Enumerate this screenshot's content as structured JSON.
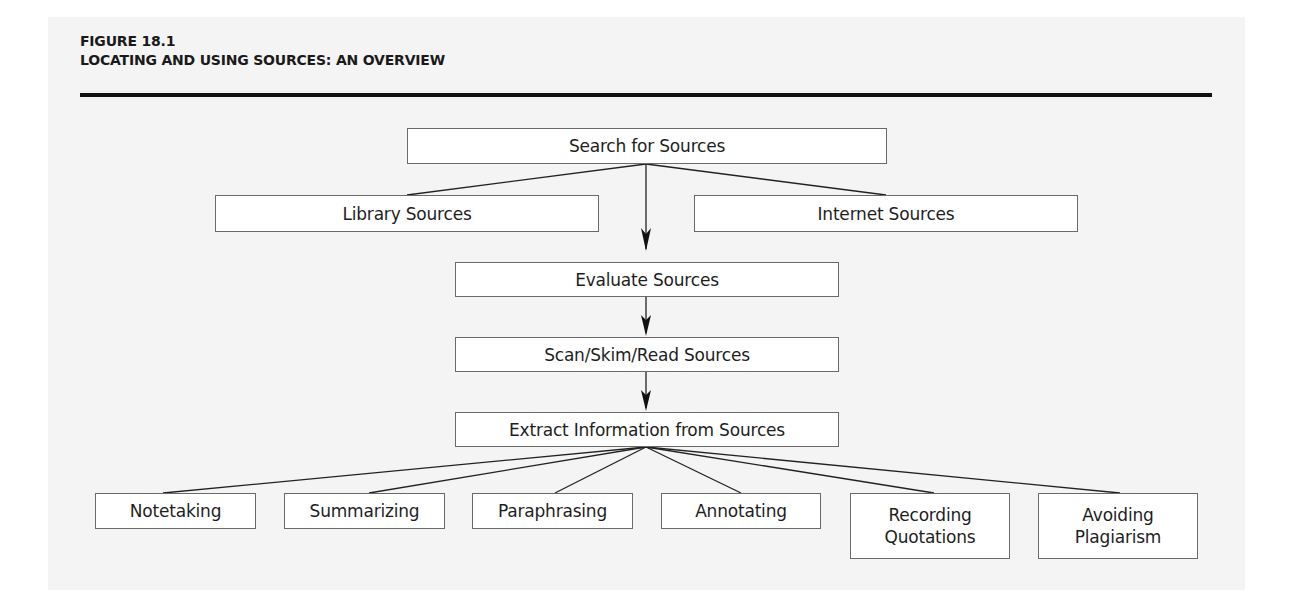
{
  "figure": {
    "label": "FIGURE 18.1",
    "title": "LOCATING AND USING SOURCES: AN OVERVIEW"
  },
  "nodes": {
    "search": "Search for Sources",
    "library": "Library Sources",
    "internet": "Internet Sources",
    "evaluate": "Evaluate Sources",
    "scan": "Scan/Skim/Read Sources",
    "extract": "Extract Information from Sources",
    "notetaking": "Notetaking",
    "summarizing": "Summarizing",
    "paraphrasing": "Paraphrasing",
    "annotating": "Annotating",
    "recording": {
      "line1": "Recording",
      "line2": "Quotations"
    },
    "avoiding": {
      "line1": "Avoiding",
      "line2": "Plagiarism"
    }
  },
  "edges": [
    {
      "from": "Search for Sources",
      "to": "Library Sources",
      "type": "line"
    },
    {
      "from": "Search for Sources",
      "to": "Internet Sources",
      "type": "line"
    },
    {
      "from": "Search for Sources",
      "to": "Evaluate Sources",
      "type": "arrow"
    },
    {
      "from": "Evaluate Sources",
      "to": "Scan/Skim/Read Sources",
      "type": "arrow"
    },
    {
      "from": "Scan/Skim/Read Sources",
      "to": "Extract Information from Sources",
      "type": "arrow"
    },
    {
      "from": "Extract Information from Sources",
      "to": "Notetaking",
      "type": "line"
    },
    {
      "from": "Extract Information from Sources",
      "to": "Summarizing",
      "type": "line"
    },
    {
      "from": "Extract Information from Sources",
      "to": "Paraphrasing",
      "type": "line"
    },
    {
      "from": "Extract Information from Sources",
      "to": "Annotating",
      "type": "line"
    },
    {
      "from": "Extract Information from Sources",
      "to": "Recording Quotations",
      "type": "line"
    },
    {
      "from": "Extract Information from Sources",
      "to": "Avoiding Plagiarism",
      "type": "line"
    }
  ],
  "colors": {
    "panel_background": "#f4f4f4",
    "box_fill": "#ffffff",
    "box_border": "#6a6a6a",
    "line": "#222222",
    "rule": "#111111"
  }
}
